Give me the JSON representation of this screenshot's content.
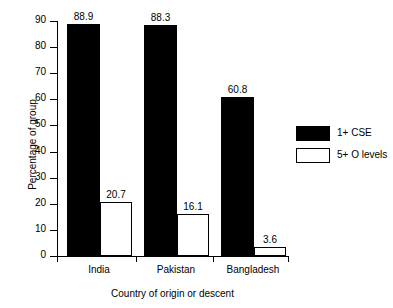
{
  "chart_data": {
    "type": "bar",
    "title": "",
    "xlabel": "Country of origin or descent",
    "ylabel": "Percentage of group",
    "categories": [
      "India",
      "Pakistan",
      "Bangladesh"
    ],
    "series": [
      {
        "name": "1+ CSE",
        "values": [
          88.9,
          88.3,
          60.8
        ],
        "fill": "#000000"
      },
      {
        "name": "5+ O levels",
        "values": [
          20.7,
          16.1,
          3.6
        ],
        "fill": "#ffffff"
      }
    ],
    "ylim": [
      0,
      90
    ],
    "yticks": [
      0,
      10,
      20,
      30,
      40,
      50,
      60,
      70,
      80,
      90
    ],
    "ytick_labels": [
      "0",
      "10",
      "20",
      "30",
      "40",
      "50",
      "60",
      "70",
      "80",
      "90"
    ],
    "grid": false,
    "legend_position": "right",
    "data_labels": [
      "88.9",
      "20.7",
      "88.3",
      "16.1",
      "60.8",
      "3.6"
    ]
  },
  "axes": {
    "y_title": "Percentage of group",
    "x_title": "Country of origin or descent"
  },
  "legend": {
    "entries": [
      {
        "label": "1+ CSE",
        "style": "filled"
      },
      {
        "label": "5+ O levels",
        "style": "open"
      }
    ]
  },
  "bars": [
    {
      "group": "India",
      "series": "1+ CSE",
      "value": 88.9,
      "label": "88.9",
      "style": "filled",
      "x": 67,
      "w": 33
    },
    {
      "group": "India",
      "series": "5+ O levels",
      "value": 20.7,
      "label": "20.7",
      "style": "open",
      "x": 100,
      "w": 32
    },
    {
      "group": "Pakistan",
      "series": "1+ CSE",
      "value": 88.3,
      "label": "88.3",
      "style": "filled",
      "x": 144,
      "w": 33
    },
    {
      "group": "Pakistan",
      "series": "5+ O levels",
      "value": 16.1,
      "label": "16.1",
      "style": "open",
      "x": 177,
      "w": 32
    },
    {
      "group": "Bangladesh",
      "series": "1+ CSE",
      "value": 60.8,
      "label": "60.8",
      "style": "filled",
      "x": 221,
      "w": 33
    },
    {
      "group": "Bangladesh",
      "series": "5+ O levels",
      "value": 3.6,
      "label": "3.6",
      "style": "open",
      "x": 254,
      "w": 32
    }
  ],
  "tick_positions": {
    "x_groups": [
      {
        "label": "India",
        "center": 99
      },
      {
        "label": "Pakistan",
        "center": 176
      },
      {
        "label": "Bangladesh",
        "center": 253
      }
    ],
    "x_ticks": [
      57,
      136,
      213,
      288
    ]
  }
}
